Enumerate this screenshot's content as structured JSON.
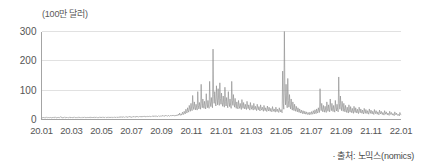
{
  "chart_data": {
    "type": "line",
    "title": "",
    "subtitle": "",
    "xlabel": "",
    "ylabel": "(100만 달러)",
    "unit_label": "(100만 달러)",
    "source_note": "· 출처: 노믹스(nomics)",
    "grid": true,
    "legend": null,
    "ylim": [
      0,
      300
    ],
    "yticks": [
      0,
      100,
      200,
      300
    ],
    "ytick_labels": [
      "0",
      "100",
      "200",
      "300"
    ],
    "xtick_labels": [
      "20.01",
      "20.03",
      "20.05",
      "20.07",
      "20.09",
      "20.11",
      "21.01",
      "21.03",
      "21.05",
      "21.07",
      "21.09",
      "21.11",
      "22.01"
    ],
    "xlim": [
      "20.01",
      "22.02"
    ],
    "line_color": "#8a8a8a",
    "grid_color": "#d9d9d9",
    "axis_color": "#9a9a9a",
    "series": [
      {
        "name": "거래량",
        "values": [
          4,
          6,
          5,
          8,
          6,
          5,
          7,
          5,
          6,
          9,
          7,
          5,
          6,
          8,
          6,
          5,
          7,
          6,
          5,
          8,
          6,
          7,
          5,
          6,
          9,
          7,
          6,
          5,
          8,
          6,
          7,
          5,
          6,
          8,
          10,
          7,
          6,
          5,
          8,
          6,
          7,
          9,
          6,
          5,
          7,
          6,
          8,
          6,
          5,
          7,
          9,
          6,
          7,
          5,
          8,
          6,
          7,
          6,
          9,
          7,
          6,
          8,
          6,
          5,
          7,
          9,
          6,
          7,
          8,
          6,
          5,
          7,
          6,
          8,
          7,
          6,
          9,
          7,
          6,
          8,
          6,
          7,
          5,
          8,
          6,
          7,
          9,
          6,
          7,
          5,
          8,
          6,
          7,
          6,
          9,
          7,
          6,
          8,
          7,
          6,
          8,
          6,
          7,
          9,
          6,
          8,
          7,
          6,
          9,
          7,
          8,
          6,
          7,
          9,
          7,
          6,
          8,
          7,
          9,
          6,
          7,
          8,
          6,
          9,
          7,
          8,
          6,
          7,
          9,
          8,
          6,
          7,
          9,
          7,
          8,
          6,
          9,
          7,
          8,
          10,
          7,
          9,
          8,
          7,
          10,
          8,
          9,
          7,
          8,
          10,
          9,
          8,
          7,
          10,
          8,
          9,
          11,
          8,
          9,
          7,
          10,
          8,
          9,
          11,
          8,
          10,
          9,
          8,
          11,
          9,
          10,
          8,
          9,
          11,
          9,
          10,
          8,
          11,
          9,
          10,
          12,
          9,
          11,
          10,
          9,
          12,
          10,
          11,
          9,
          10,
          12,
          11,
          9,
          10,
          12,
          10,
          11,
          13,
          10,
          12,
          11,
          10,
          13,
          11,
          12,
          10,
          11,
          13,
          12,
          10,
          11,
          13,
          11,
          12,
          14,
          11,
          13,
          12,
          11,
          14,
          12,
          13,
          11,
          12,
          14,
          13,
          11,
          12,
          14,
          12,
          13,
          15,
          12,
          14,
          13,
          12,
          15,
          13,
          14,
          12,
          16,
          14,
          18,
          15,
          22,
          17,
          14,
          19,
          16,
          25,
          20,
          17,
          28,
          22,
          19,
          35,
          26,
          22,
          40,
          30,
          25,
          48,
          35,
          28,
          55,
          38,
          30,
          82,
          45,
          34,
          60,
          42,
          33,
          52,
          40,
          32,
          95,
          48,
          36,
          58,
          44,
          35,
          120,
          55,
          40,
          70,
          48,
          38,
          62,
          45,
          36,
          88,
          52,
          40,
          65,
          46,
          38,
          130,
          60,
          44,
          75,
          50,
          40,
          240,
          85,
          55,
          95,
          60,
          46,
          115,
          70,
          50,
          105,
          65,
          48,
          125,
          72,
          52,
          90,
          58,
          45,
          80,
          52,
          42,
          110,
          62,
          46,
          75,
          50,
          40,
          95,
          58,
          44,
          70,
          48,
          38,
          130,
          65,
          48,
          85,
          55,
          42,
          72,
          48,
          38,
          60,
          44,
          36,
          65,
          46,
          38,
          55,
          42,
          34,
          68,
          48,
          38,
          58,
          44,
          36,
          52,
          40,
          34,
          62,
          45,
          37,
          50,
          38,
          32,
          58,
          42,
          35,
          48,
          38,
          32,
          55,
          42,
          34,
          45,
          36,
          30,
          52,
          40,
          33,
          44,
          35,
          29,
          50,
          38,
          32,
          42,
          34,
          28,
          48,
          36,
          30,
          40,
          32,
          27,
          46,
          35,
          29,
          42,
          33,
          28,
          38,
          30,
          26,
          44,
          34,
          28,
          36,
          29,
          25,
          42,
          32,
          27,
          35,
          28,
          24,
          40,
          31,
          26,
          34,
          27,
          23,
          165,
          55,
          35,
          300,
          90,
          50,
          120,
          60,
          40,
          140,
          65,
          42,
          85,
          50,
          36,
          70,
          44,
          32,
          60,
          40,
          30,
          52,
          36,
          28,
          45,
          33,
          26,
          40,
          30,
          24,
          36,
          27,
          22,
          32,
          25,
          20,
          30,
          23,
          19,
          28,
          22,
          18,
          26,
          20,
          17,
          24,
          19,
          16,
          25,
          20,
          17,
          27,
          21,
          18,
          30,
          23,
          19,
          33,
          25,
          20,
          36,
          27,
          22,
          40,
          30,
          24,
          105,
          45,
          30,
          55,
          35,
          26,
          48,
          33,
          25,
          45,
          32,
          24,
          60,
          38,
          28,
          50,
          34,
          26,
          70,
          42,
          30,
          55,
          36,
          27,
          48,
          33,
          25,
          65,
          40,
          29,
          52,
          35,
          26,
          145,
          55,
          35,
          80,
          45,
          30,
          62,
          40,
          28,
          55,
          36,
          26,
          48,
          33,
          24,
          42,
          30,
          22,
          50,
          34,
          25,
          44,
          31,
          23,
          38,
          28,
          21,
          45,
          32,
          24,
          40,
          29,
          22,
          35,
          26,
          20,
          42,
          30,
          23,
          36,
          27,
          21,
          32,
          24,
          19,
          38,
          28,
          21,
          34,
          25,
          20,
          30,
          23,
          18,
          36,
          27,
          21,
          32,
          24,
          19,
          28,
          22,
          17,
          34,
          25,
          20,
          30,
          23,
          18,
          26,
          20,
          16,
          32,
          24,
          19,
          28,
          22,
          17,
          24,
          19,
          15,
          30,
          23,
          18,
          26,
          20,
          16,
          22,
          17,
          14,
          28,
          21,
          17,
          24,
          19,
          15,
          20,
          16,
          13,
          26,
          20,
          16,
          22,
          17,
          14,
          18,
          15,
          12,
          24,
          19,
          15
        ]
      }
    ]
  }
}
